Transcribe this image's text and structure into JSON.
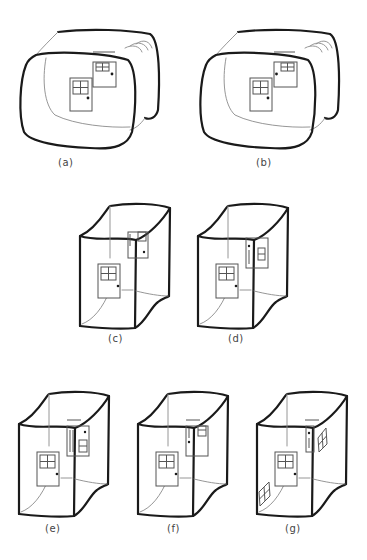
{
  "figure": {
    "panels": [
      {
        "id": "a",
        "label": "(a)",
        "shape": "rounded-room",
        "variant": "window-door-back"
      },
      {
        "id": "b",
        "label": "(b)",
        "shape": "rounded-room",
        "variant": "door-knob-left-back"
      },
      {
        "id": "c",
        "label": "(c)",
        "shape": "box-room",
        "variant": "side-door-knob-right"
      },
      {
        "id": "d",
        "label": "(d)",
        "shape": "box-room",
        "variant": "side-door-knob-left"
      },
      {
        "id": "e",
        "label": "(e)",
        "shape": "box-room",
        "variant": "side-window-low"
      },
      {
        "id": "f",
        "label": "(f)",
        "shape": "box-room",
        "variant": "side-door-knob-left-window-high"
      },
      {
        "id": "g",
        "label": "(g)",
        "shape": "box-room",
        "variant": "skewed-windows"
      }
    ],
    "colors": {
      "stroke": "#1a1a1a",
      "thin_stroke": "#8a8a8a",
      "background": "#ffffff"
    }
  }
}
